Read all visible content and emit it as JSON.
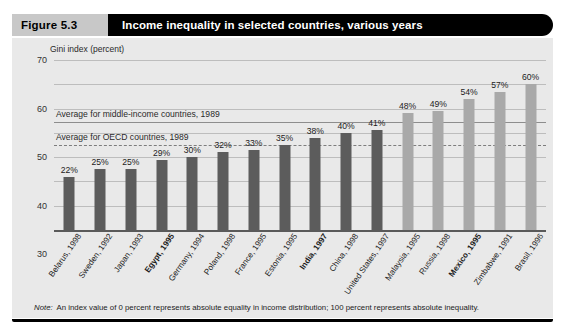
{
  "figure": {
    "number_label": "Figure 5.3",
    "title": "Income inequality in selected countries, various years",
    "note_lead": "Note:",
    "note_body": "An index value of 0 percent represents absolute equality in income distribution; 100 percent represents absolute inequality."
  },
  "colors": {
    "header_bar": "#000000",
    "figure_number_bg": "#c8c8c8",
    "panel_bg": "#e9e9e9",
    "bar_dark": "#5c5c5c",
    "bar_light": "#a9a9a9",
    "gridline": "#bdbdbd",
    "reference_line": "#8d8d8d"
  },
  "chart_data": {
    "type": "bar",
    "title": "Income inequality in selected countries, various years",
    "subtitle": "",
    "xlabel": "",
    "ylabel": "Gini index (percent)",
    "ylim": [
      0,
      70
    ],
    "yticks": [
      0,
      10,
      20,
      30,
      40,
      50,
      60,
      70
    ],
    "ytick_labels": [
      "0",
      "10",
      "20",
      "30",
      "40",
      "50",
      "60",
      "70"
    ],
    "grid": true,
    "legend": "none",
    "value_label_suffix": "%",
    "categories": [
      "Belarus, 1998",
      "Sweden, 1992",
      "Japan, 1993",
      "Egypt, 1995",
      "Germany, 1994",
      "Poland, 1998",
      "France, 1995",
      "Estonia, 1995",
      "India, 1997",
      "China, 1998",
      "United States, 1997",
      "Malaysia, 1995",
      "Russia, 1998",
      "Mexico, 1995",
      "Zimbabwe, 1991",
      "Brasil, 1996"
    ],
    "values": [
      22,
      25,
      25,
      29,
      30,
      32,
      33,
      35,
      38,
      40,
      41,
      48,
      49,
      54,
      57,
      60
    ],
    "value_labels": [
      "22%",
      "25%",
      "25%",
      "29%",
      "30%",
      "32%",
      "33%",
      "35%",
      "38%",
      "40%",
      "41%",
      "48%",
      "49%",
      "54%",
      "57%",
      "60%"
    ],
    "bar_shades": [
      "dark",
      "dark",
      "dark",
      "dark",
      "dark",
      "dark",
      "dark",
      "dark",
      "dark",
      "dark",
      "dark",
      "light",
      "light",
      "light",
      "light",
      "light"
    ],
    "category_emphasis": [
      false,
      false,
      false,
      true,
      false,
      false,
      false,
      false,
      true,
      false,
      false,
      false,
      false,
      true,
      false,
      false
    ],
    "reference_lines": [
      {
        "label": "Average for middle-income countries, 1989",
        "value": 44.5,
        "style": "solid"
      },
      {
        "label": "Average for OECD countries, 1989",
        "value": 35,
        "style": "dashed"
      }
    ]
  }
}
